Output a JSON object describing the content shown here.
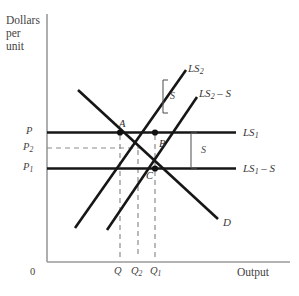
{
  "figure": {
    "type": "economics-supply-demand-diagram",
    "background": "#ffffff",
    "ink": "#1a1a1a",
    "dashed_color": "#8c8c8c",
    "axis_color": "#9a9a9a"
  },
  "axes": {
    "y_title_lines": [
      "Dollars",
      "per",
      "unit"
    ],
    "x_title": "Output",
    "origin_label": "0",
    "y_ticks": [
      {
        "id": "P",
        "base": "P",
        "sub": "",
        "value_y": 132
      },
      {
        "id": "P2",
        "base": "P",
        "sub": "2",
        "value_y": 148
      },
      {
        "id": "P1",
        "base": "P",
        "sub": "1",
        "value_y": 168
      }
    ],
    "x_ticks": [
      {
        "id": "Q",
        "base": "Q",
        "sub": "",
        "value_x": 120
      },
      {
        "id": "Q2",
        "base": "Q",
        "sub": "2",
        "value_x": 138
      },
      {
        "id": "Q1",
        "base": "Q",
        "sub": "1",
        "value_x": 155
      }
    ]
  },
  "curves": [
    {
      "name": "demand",
      "label_base": "D",
      "label_sub": "",
      "label_suffix": "",
      "slope": "downward"
    },
    {
      "name": "ls2",
      "label_base": "LS",
      "label_sub": "2",
      "label_suffix": "",
      "slope": "upward"
    },
    {
      "name": "ls2-minus-s",
      "label_base": "LS",
      "label_sub": "2",
      "label_suffix": " – S",
      "slope": "upward"
    },
    {
      "name": "ls1",
      "label_base": "LS",
      "label_sub": "1",
      "label_suffix": "",
      "slope": "horizontal"
    },
    {
      "name": "ls1-minus-s",
      "label_base": "LS",
      "label_sub": "1",
      "label_suffix": " – S",
      "slope": "horizontal"
    }
  ],
  "points": [
    {
      "id": "A",
      "label": "A",
      "x": 120,
      "y": 132,
      "dot": true
    },
    {
      "id": "B",
      "label": "B",
      "x": 155,
      "y": 133,
      "dot": true
    },
    {
      "id": "C",
      "label": "C",
      "x": 155,
      "y": 168,
      "dot": true
    }
  ],
  "brackets": [
    {
      "id": "upper-s",
      "label": "S",
      "between": [
        "ls2",
        "ls2-minus-s"
      ]
    },
    {
      "id": "lower-s",
      "label": "S",
      "between": [
        "ls1",
        "ls1-minus-s"
      ]
    }
  ],
  "labels": {
    "y_title_1": "Dollars",
    "y_title_2": "per",
    "y_title_3": "unit",
    "x_title": "Output",
    "origin": "0",
    "tick_P": "P",
    "tick_P2_base": "P",
    "tick_P2_sub": "2",
    "tick_P1_base": "P",
    "tick_P1_sub": "1",
    "tick_Q": "Q",
    "tick_Q2_base": "Q",
    "tick_Q2_sub": "2",
    "tick_Q1_base": "Q",
    "tick_Q1_sub": "1",
    "point_A": "A",
    "point_B": "B",
    "point_C": "C",
    "curve_D": "D",
    "curve_LS2_base": "LS",
    "curve_LS2_sub": "2",
    "curve_LS2mS_base": "LS",
    "curve_LS2mS_sub": "2",
    "curve_LS2mS_suffix": " – S",
    "curve_LS1_base": "LS",
    "curve_LS1_sub": "1",
    "curve_LS1mS_base": "LS",
    "curve_LS1mS_sub": "1",
    "curve_LS1mS_suffix": " – S",
    "bracket_upper_S": "S",
    "bracket_lower_S": "S"
  }
}
